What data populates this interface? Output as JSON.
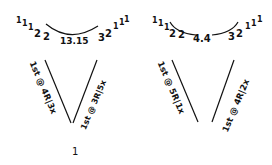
{
  "diagram": {
    "ink_color": "#111111",
    "background": "#ffffff",
    "panels": [
      {
        "id": "left",
        "top_labels": {
          "left_counts": [
            "1",
            "1",
            "1",
            "2",
            "2"
          ],
          "center": "13.15",
          "right_counts": [
            "3",
            "2",
            "1",
            "1",
            "1"
          ]
        },
        "left_branch": "1st @ 4R|3x",
        "right_branch": "1st @ 3R|5x",
        "bottom_mark": "1"
      },
      {
        "id": "right",
        "top_labels": {
          "left_counts": [
            "1",
            "1",
            "1",
            "2",
            "2"
          ],
          "center": "4.4",
          "right_counts": [
            "3",
            "2",
            "1",
            "1",
            "1"
          ]
        },
        "left_branch": "1st @ 5R|1x",
        "right_branch": "1st @ 4R|2x"
      }
    ]
  }
}
